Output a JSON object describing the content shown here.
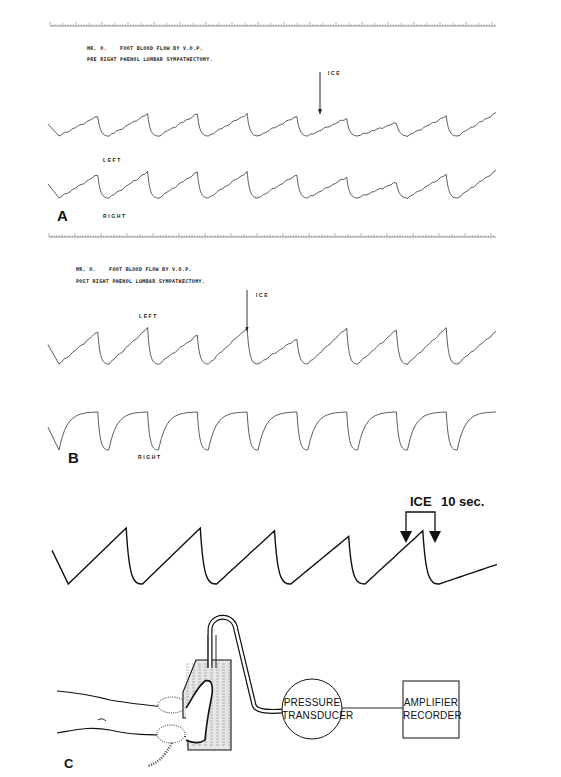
{
  "figure": {
    "panels": [
      {
        "letter": "A",
        "header_line1": "MR. O.    FOOT BLOOD FLOW BY V.O.P.",
        "header_line2": "PRE RIGHT PHENOL LUMBAR SYMPATHECTOMY.",
        "marker_label": "ICE",
        "trace_labels": [
          "LEFT",
          "RIGHT"
        ]
      },
      {
        "letter": "B",
        "header_line1": "MR. O.    FOOT BLOOD FLOW BY V.O.P.",
        "header_line2": "POST RIGHT PHENOL LUMBAR SYMPATHECTOMY.",
        "marker_label": "ICE",
        "trace_labels": [
          "LEFT",
          "RIGHT"
        ]
      },
      {
        "letter": "C",
        "marker_label": "ICE",
        "interval_label": "10 sec.",
        "diagram": {
          "transducer_line1": "PRESSURE",
          "transducer_line2": "TRANSDUCER",
          "recorder_line1": "AMPLIFIER",
          "recorder_line2": "RECORDER"
        }
      }
    ]
  },
  "chart_data": [
    {
      "type": "line",
      "title": "MR. O. FOOT BLOOD FLOW BY V.O.P. — PRE RIGHT PHENOL LUMBAR SYMPATHECTOMY.",
      "panel": "A",
      "xlabel": "",
      "ylabel": "",
      "annotation": {
        "label": "ICE",
        "at_cycle": 6
      },
      "series": [
        {
          "name": "LEFT",
          "cycles": 9,
          "peak_rel": [
            0.9,
            1.0,
            1.0,
            1.0,
            0.9,
            0.8,
            0.6,
            0.9,
            1.05
          ],
          "note": "sawtooth venous occlusion plethysmography; amplitude reduced after ICE"
        },
        {
          "name": "RIGHT",
          "cycles": 9,
          "peak_rel": [
            0.9,
            1.0,
            1.0,
            1.0,
            0.9,
            0.8,
            0.6,
            0.9,
            1.05
          ]
        }
      ]
    },
    {
      "type": "line",
      "title": "MR. O. FOOT BLOOD FLOW BY V.O.P. — POST RIGHT PHENOL LUMBAR SYMPATHECTOMY.",
      "panel": "B",
      "xlabel": "",
      "ylabel": "",
      "annotation": {
        "label": "ICE",
        "at_cycle": 5
      },
      "series": [
        {
          "name": "LEFT",
          "cycles": 9,
          "peak_rel": [
            0.9,
            1.0,
            0.8,
            1.0,
            0.7,
            1.0,
            0.95,
            1.0,
            0.9
          ],
          "shape": "sawtooth"
        },
        {
          "name": "RIGHT",
          "cycles": 9,
          "peak_rel": [
            1,
            1,
            1,
            1,
            1,
            1,
            1,
            1,
            1
          ],
          "shape": "square-plateau"
        }
      ]
    },
    {
      "type": "line",
      "title": "",
      "panel": "C",
      "annotation": {
        "label": "ICE",
        "interval": "10 sec.",
        "at_cycle": 5
      },
      "series": [
        {
          "name": "schematic",
          "cycles": 6,
          "peak_rel": [
            1.0,
            1.0,
            0.95,
            0.85,
            0.95,
            0.35
          ]
        }
      ]
    }
  ]
}
